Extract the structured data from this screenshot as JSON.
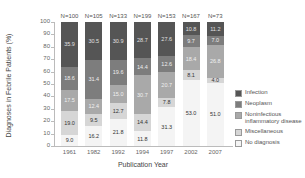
{
  "chart_data": {
    "type": "bar",
    "stacked": true,
    "title": "",
    "xlabel": "Publication Year",
    "ylabel": "Diagnoses in Febrile Patients (%)",
    "ylim": [
      0,
      100
    ],
    "yticks": [
      0,
      10,
      20,
      30,
      40,
      50,
      60,
      70,
      80,
      90,
      100
    ],
    "categories": [
      "1961",
      "1982",
      "1992",
      "1994",
      "1997",
      "2002",
      "2007"
    ],
    "sample_sizes": [
      "N=100",
      "N=105",
      "N=133",
      "N=199",
      "N=153",
      "N=167",
      "N=73"
    ],
    "legend_position": "right",
    "series": [
      {
        "name": "No diagnosis",
        "color": "#f4f4f4",
        "label_color": "#333333",
        "values": [
          9.0,
          16.2,
          21.8,
          11.8,
          31.3,
          53.0,
          51.0
        ]
      },
      {
        "name": "Miscellaneous",
        "color": "#d6d6d6",
        "label_color": "#333333",
        "values": [
          19.0,
          9.5,
          12.7,
          14.4,
          7.8,
          8.1,
          4.0
        ]
      },
      {
        "name": "Noninfectious inflammatory disease",
        "color": "#a9a9a9",
        "label_color": "#f0f0f0",
        "values": [
          17.5,
          12.4,
          15.0,
          30.7,
          20.7,
          18.4,
          26.8
        ]
      },
      {
        "name": "Neoplasm",
        "color": "#7d7d7d",
        "label_color": "#eeeeee",
        "values": [
          18.6,
          31.4,
          19.6,
          14.4,
          12.6,
          9.7,
          7.0
        ]
      },
      {
        "name": "Infection",
        "color": "#555555",
        "label_color": "#e0e0e0",
        "values": [
          35.9,
          30.5,
          30.9,
          28.7,
          27.6,
          10.8,
          11.2
        ]
      }
    ],
    "legend": [
      {
        "name": "Infection",
        "color": "#555555"
      },
      {
        "name": "Neoplasm",
        "color": "#7d7d7d"
      },
      {
        "name": "Noninfectious inflammatory disease",
        "color": "#a9a9a9"
      },
      {
        "name": "Miscellaneous",
        "color": "#d6d6d6"
      },
      {
        "name": "No diagnosis",
        "color": "#f4f4f4"
      }
    ]
  }
}
